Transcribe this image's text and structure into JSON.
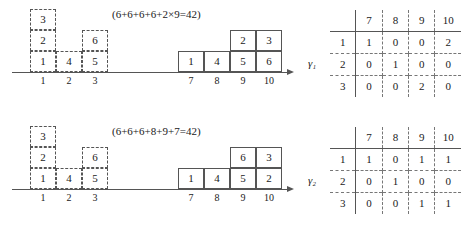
{
  "figure": {
    "panels": [
      {
        "id": "panel-top",
        "equation": "(6+6+6+6+2×9=42)",
        "left_schematic": {
          "kind": "dashed-bin-packing",
          "axis_tick_labels": [
            "1",
            "2",
            "3"
          ],
          "columns": [
            {
              "position": "1",
              "items_bottom_to_top": [
                "1",
                "2",
                "3"
              ]
            },
            {
              "position": "2",
              "items_bottom_to_top": [
                "4"
              ]
            },
            {
              "position": "3",
              "items_bottom_to_top": [
                "5",
                "6"
              ]
            }
          ]
        },
        "right_schematic": {
          "kind": "solid-bin-packing",
          "axis_tick_labels": [
            "7",
            "8",
            "9",
            "10"
          ],
          "columns": [
            {
              "position": "7",
              "items_bottom_to_top": [
                "1"
              ]
            },
            {
              "position": "8",
              "items_bottom_to_top": [
                "4"
              ]
            },
            {
              "position": "9",
              "items_bottom_to_top": [
                "5",
                "2"
              ]
            },
            {
              "position": "10",
              "items_bottom_to_top": [
                "6",
                "3"
              ]
            }
          ]
        },
        "matrix": {
          "label": "γ₁",
          "column_headers": [
            "7",
            "8",
            "9",
            "10"
          ],
          "row_headers": [
            "1",
            "2",
            "3"
          ],
          "rows": [
            [
              "1",
              "0",
              "0",
              "2"
            ],
            [
              "0",
              "1",
              "0",
              "0"
            ],
            [
              "0",
              "0",
              "2",
              "0"
            ]
          ]
        }
      },
      {
        "id": "panel-bottom",
        "equation": "(6+6+6+8+9+7=42)",
        "left_schematic": {
          "kind": "dashed-bin-packing",
          "axis_tick_labels": [
            "1",
            "2",
            "3"
          ],
          "columns": [
            {
              "position": "1",
              "items_bottom_to_top": [
                "1",
                "2",
                "3"
              ]
            },
            {
              "position": "2",
              "items_bottom_to_top": [
                "4"
              ]
            },
            {
              "position": "3",
              "items_bottom_to_top": [
                "5",
                "6"
              ]
            }
          ]
        },
        "right_schematic": {
          "kind": "solid-bin-packing",
          "axis_tick_labels": [
            "7",
            "8",
            "9",
            "10"
          ],
          "columns": [
            {
              "position": "7",
              "items_bottom_to_top": [
                "1"
              ]
            },
            {
              "position": "8",
              "items_bottom_to_top": [
                "4"
              ]
            },
            {
              "position": "9",
              "items_bottom_to_top": [
                "5",
                "6"
              ]
            },
            {
              "position": "10",
              "items_bottom_to_top": [
                "2",
                "3"
              ]
            }
          ]
        },
        "matrix": {
          "label": "γ₂",
          "column_headers": [
            "7",
            "8",
            "9",
            "10"
          ],
          "row_headers": [
            "1",
            "2",
            "3"
          ],
          "rows": [
            [
              "1",
              "0",
              "1",
              "1"
            ],
            [
              "0",
              "1",
              "0",
              "0"
            ],
            [
              "0",
              "0",
              "1",
              "1"
            ]
          ]
        }
      }
    ]
  }
}
